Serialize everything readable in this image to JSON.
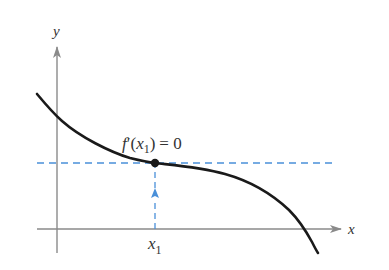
{
  "diagram": {
    "axes": {
      "x_label": "x",
      "y_label": "y",
      "color": "#8a8a8a"
    },
    "curve": {
      "name": "f",
      "color": "#1a1a1a",
      "description": "decreasing curve with a horizontal tangent (inflection-like flat point) at x1"
    },
    "point": {
      "label_function": "f",
      "label_prime": "′",
      "label_open": "(",
      "label_var": "x",
      "label_sub": "1",
      "label_close": ")",
      "label_equals": "= 0",
      "full_label": "f′(x₁) = 0",
      "color": "#1a1a1a"
    },
    "x_tick": {
      "var": "x",
      "sub": "1",
      "full_label": "x₁"
    },
    "guides": {
      "color": "#4a90d9",
      "horizontal": "dashed horizontal tangent line through (x1, f(x1))",
      "vertical": "dashed vertical line with upward arrow from x1 to the curve"
    }
  }
}
